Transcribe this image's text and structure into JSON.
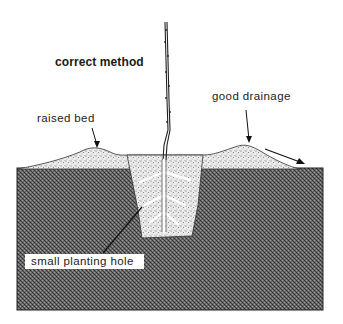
{
  "diagram": {
    "title": "correct method",
    "labels": {
      "raised_bed": "raised bed",
      "good_drainage": "good drainage",
      "small_planting_hole": "small planting hole"
    },
    "colors": {
      "soil": "#5a5a5a",
      "fill": "#e6e6e6",
      "ink": "#1a1a1a",
      "background": "#ffffff"
    }
  }
}
